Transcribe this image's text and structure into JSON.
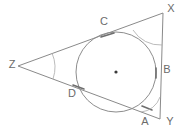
{
  "figure": {
    "type": "geometry-diagram",
    "background_color": "#ffffff",
    "line_color": "#8a8a8a",
    "label_color": "#6b6b6b",
    "angle_label_color": "#b0b0b0",
    "triangle": {
      "name": "triangle-XYZ",
      "vertices": [
        {
          "label": "Z",
          "x": 18,
          "y": 66,
          "label_x": 12,
          "label_y": 65
        },
        {
          "label": "X",
          "x": 163,
          "y": 13,
          "label_x": 171,
          "label_y": 9
        },
        {
          "label": "Y",
          "x": 160,
          "y": 119,
          "label_x": 170,
          "label_y": 122
        }
      ]
    },
    "circle": {
      "name": "inscribed-circle",
      "center_x": 116,
      "center_y": 72,
      "radius": 40,
      "center_dot_label": "center"
    },
    "tangent_points": [
      {
        "label": "C",
        "x": 108,
        "y": 36,
        "label_x": 104,
        "label_y": 22
      },
      {
        "label": "B",
        "x": 156,
        "y": 73,
        "label_x": 167,
        "label_y": 70
      },
      {
        "label": "A",
        "x": 147,
        "y": 108,
        "label_x": 145,
        "label_y": 122
      },
      {
        "label": "D",
        "x": 78,
        "y": 87,
        "label_x": 72,
        "label_y": 94
      }
    ],
    "angle_marks": [
      {
        "vertex": "Z",
        "label": "",
        "label_x": 71,
        "label_y": 64,
        "rotation": -35
      },
      {
        "vertex": "X",
        "label": "",
        "label_x": 146,
        "label_y": 33,
        "rotation": -35
      },
      {
        "vertex": "Y",
        "label": "",
        "label_x": 153,
        "label_y": 105,
        "rotation": -35
      }
    ]
  }
}
